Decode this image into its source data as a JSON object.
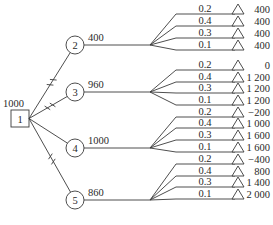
{
  "diagram": {
    "type": "decision-tree",
    "decision_node": {
      "id": "1",
      "value": "1000"
    },
    "chance_nodes": [
      {
        "id": "2",
        "value": "400",
        "pruned": false,
        "outcomes": [
          {
            "prob": "0.2",
            "payoff": "400"
          },
          {
            "prob": "0.4",
            "payoff": "400"
          },
          {
            "prob": "0.3",
            "payoff": "400"
          },
          {
            "prob": "0.1",
            "payoff": "400"
          }
        ]
      },
      {
        "id": "3",
        "value": "960",
        "pruned": true,
        "outcomes": [
          {
            "prob": "0.2",
            "payoff": "0"
          },
          {
            "prob": "0.4",
            "payoff": "1 200"
          },
          {
            "prob": "0.3",
            "payoff": "1 200"
          },
          {
            "prob": "0.1",
            "payoff": "1 200"
          }
        ]
      },
      {
        "id": "4",
        "value": "1000",
        "pruned": false,
        "outcomes": [
          {
            "prob": "0.2",
            "payoff": "−200"
          },
          {
            "prob": "0.4",
            "payoff": "1 000"
          },
          {
            "prob": "0.3",
            "payoff": "1 600"
          },
          {
            "prob": "0.1",
            "payoff": "1 600"
          }
        ]
      },
      {
        "id": "5",
        "value": "860",
        "pruned": true,
        "outcomes": [
          {
            "prob": "0.2",
            "payoff": "−400"
          },
          {
            "prob": "0.4",
            "payoff": "800"
          },
          {
            "prob": "0.3",
            "payoff": "1 400"
          },
          {
            "prob": "0.1",
            "payoff": "2 000"
          }
        ]
      }
    ],
    "pruned_branches_note": "branches to nodes 2, 3 and 5 carry double-slash prune marks",
    "colors": {
      "line": "#3a3a3a",
      "text": "#2a2a2a",
      "background": "#ffffff"
    }
  }
}
